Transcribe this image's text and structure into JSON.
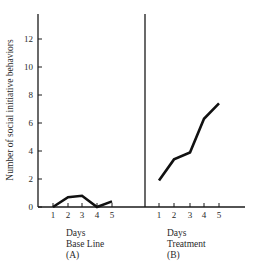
{
  "chart_data": {
    "type": "line",
    "title": "",
    "ylabel": "Number of social initiative behaviors",
    "ylim": [
      0,
      14
    ],
    "yticks": [
      0,
      2,
      4,
      6,
      8,
      10,
      12
    ],
    "grid": false,
    "legend": null,
    "panels": [
      {
        "id": "A",
        "xlabel": "Days",
        "phase": "Base Line",
        "tag": "(A)",
        "x": [
          1,
          2,
          3,
          4,
          5
        ],
        "values": [
          0.0,
          0.7,
          0.8,
          0.0,
          0.4
        ]
      },
      {
        "id": "B",
        "xlabel": "Days",
        "phase": "Treatment",
        "tag": "(B)",
        "x": [
          1,
          2,
          3,
          4,
          5
        ],
        "values": [
          1.9,
          3.4,
          3.9,
          6.3,
          7.4
        ]
      }
    ],
    "annotations": [
      "vertical divider line separating Base Line and Treatment phases"
    ]
  },
  "captions": {
    "a_days": "Days",
    "a_phase": "Base Line",
    "a_tag": "(A)",
    "b_days": "Days",
    "b_phase": "Treatment",
    "b_tag": "(B)"
  },
  "colors": {
    "line": "#111111",
    "axis": "#1a1a1a",
    "text": "#2a2a2a",
    "background": "#ffffff"
  }
}
